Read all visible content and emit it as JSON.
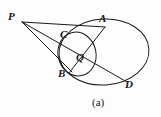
{
  "figure": {
    "caption": "(a)",
    "background_color": "#fdfdfd",
    "stroke_color": "#1a1a1a",
    "label_color": "#141414",
    "width": 161,
    "height": 117
  },
  "points": [
    {
      "name": "P",
      "label": "P",
      "x": 22,
      "y": 22,
      "label_x": 8,
      "label_y": 11
    },
    {
      "name": "A",
      "label": "A",
      "x": 104,
      "y": 27,
      "label_x": 99,
      "label_y": 13
    },
    {
      "name": "C",
      "label": "C",
      "x": 70,
      "y": 39,
      "label_x": 60,
      "label_y": 29
    },
    {
      "name": "Q",
      "label": "Q",
      "x": 81,
      "y": 57,
      "label_x": 76,
      "label_y": 52
    },
    {
      "name": "B",
      "label": "B",
      "x": 71,
      "y": 70,
      "label_x": 58,
      "label_y": 68
    },
    {
      "name": "D",
      "label": "D",
      "x": 124,
      "y": 80,
      "label_x": 125,
      "label_y": 79
    }
  ],
  "shapes": {
    "large_ellipse": {
      "name": "main-circle",
      "cx": 104,
      "cy": 52,
      "rx": 45,
      "ry": 33,
      "rotation": -4
    },
    "small_ellipse": {
      "name": "secondary-circle",
      "cx": 77,
      "cy": 54,
      "rx": 19,
      "ry": 22,
      "rotation": -12
    }
  },
  "segments": [
    {
      "name": "segment-PA",
      "from": "P",
      "to": "A"
    },
    {
      "name": "segment-PCQD",
      "from": "P",
      "to": "D"
    },
    {
      "name": "segment-PB",
      "from": "P",
      "to": "B"
    },
    {
      "name": "segment-AQB",
      "from": "A",
      "to": "B"
    }
  ]
}
